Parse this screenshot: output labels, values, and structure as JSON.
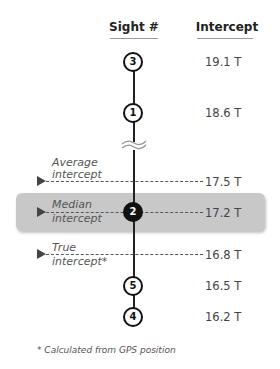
{
  "headers": {
    "sight": "Sight #",
    "intercept": "Intercept"
  },
  "sights": [
    {
      "id": "3",
      "intercept": "19.1 T"
    },
    {
      "id": "1",
      "intercept": "18.6 T"
    },
    {
      "id": "2",
      "intercept": "17.2 T"
    },
    {
      "id": "5",
      "intercept": "16.5 T"
    },
    {
      "id": "4",
      "intercept": "16.2 T"
    }
  ],
  "markers": {
    "average": {
      "label_line1": "Average",
      "label_line2": "intercept",
      "value": "17.5 T"
    },
    "median": {
      "label_line1": "Median",
      "label_line2": "intercept",
      "value": "17.2 T"
    },
    "true": {
      "label_line1": "True",
      "label_line2": "intercept*",
      "value": "16.8 T"
    }
  },
  "footnote": "* Calculated from GPS position",
  "colors": {
    "highlight_box": "#c8c8c8",
    "line": "#222222"
  }
}
